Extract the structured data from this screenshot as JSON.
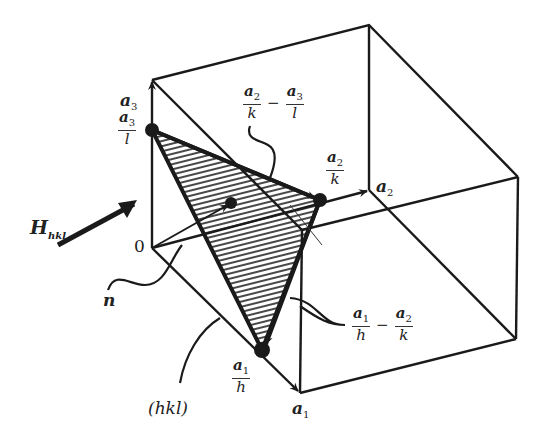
{
  "figure": {
    "labels": {
      "a3": {
        "sym": "a",
        "sub": "3"
      },
      "a2": {
        "sym": "a",
        "sub": "2"
      },
      "a1": {
        "sym": "a",
        "sub": "1"
      },
      "origin": "0",
      "H": {
        "sym": "H",
        "sub": "hkl"
      },
      "n": "n",
      "plane": "(hkl)",
      "a3_over_l": {
        "num": "a",
        "num_sub": "3",
        "den": "l"
      },
      "a2_over_k": {
        "num": "a",
        "num_sub": "2",
        "den": "k"
      },
      "a1_over_h": {
        "num": "a",
        "num_sub": "1",
        "den": "h"
      },
      "edge_23": {
        "left": {
          "num": "a",
          "num_sub": "2",
          "den": "k"
        },
        "op": "−",
        "right": {
          "num": "a",
          "num_sub": "3",
          "den": "l"
        }
      },
      "edge_12": {
        "left": {
          "num": "a",
          "num_sub": "1",
          "den": "h"
        },
        "op": "−",
        "right": {
          "num": "a",
          "num_sub": "2",
          "den": "k"
        }
      }
    },
    "colors": {
      "ink": "#1a1a1a",
      "background": "#ffffff"
    }
  }
}
